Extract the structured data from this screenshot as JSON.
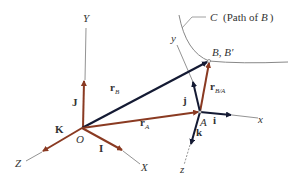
{
  "figure": {
    "colors": {
      "brown": "#8a3a22",
      "navy": "#141a33",
      "axis": "#777777",
      "curve": "#888888",
      "text": "#333333"
    },
    "path": {
      "label_letter": "C",
      "label_text": "(Path of ",
      "label_point": "B",
      "label_close": ")"
    },
    "points": {
      "origin": "O",
      "point_a": "A",
      "point_b": "B, B′"
    },
    "fixed_axes": {
      "X": "X",
      "Y": "Y",
      "Z": "Z",
      "unit_I": "I",
      "unit_J": "J",
      "unit_K": "K"
    },
    "moving_axes": {
      "x": "x",
      "y": "y",
      "z": "z",
      "unit_i": "i",
      "unit_j": "j",
      "unit_k": "k"
    },
    "vectors": {
      "rB_main": "r",
      "rB_sub": "B",
      "rA_main": "r",
      "rA_sub": "A",
      "rBA_main": "r",
      "rBA_sub": "B/A"
    }
  }
}
